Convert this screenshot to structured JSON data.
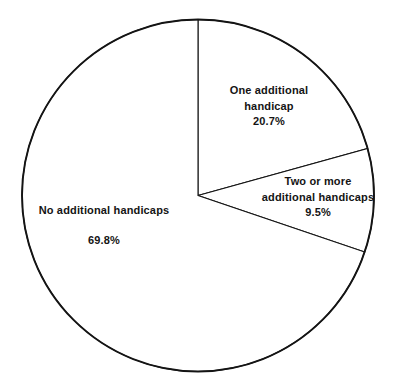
{
  "chart_data": {
    "type": "pie",
    "title": "",
    "subtitle": "",
    "xlabel": "",
    "ylabel": "",
    "legend_position": "none",
    "grid": false,
    "units": "percent",
    "total": 100,
    "start_angle_deg": 0,
    "direction": "clockwise",
    "categories": [
      "One additional handicap",
      "Two or more additional handicaps",
      "No additional handicaps"
    ],
    "values": [
      20.7,
      9.5,
      69.8
    ],
    "value_labels": [
      "20.7%",
      "9.5%",
      "69.8%"
    ],
    "slices": [
      {
        "name": "One additional handicap",
        "label_line1": "One additional",
        "label_line2": "handicap",
        "value": 20.7,
        "value_label": "20.7%",
        "start_deg": 0,
        "end_deg": 74.5,
        "fill": "#ffffff",
        "stroke": "#141414"
      },
      {
        "name": "Two or more additional handicaps",
        "label_line1": "Two or more",
        "label_line2": "additional handicaps",
        "value": 9.5,
        "value_label": "9.5%",
        "start_deg": 74.5,
        "end_deg": 108.7,
        "fill": "#ffffff",
        "stroke": "#141414"
      },
      {
        "name": "No additional handicaps",
        "label_line1": "No additional handicaps",
        "label_line2": "",
        "value": 69.8,
        "value_label": "69.8%",
        "start_deg": 108.7,
        "end_deg": 360,
        "fill": "#ffffff",
        "stroke": "#141414"
      }
    ]
  },
  "colors": {
    "background": "#ffffff",
    "outline": "#141414",
    "divider": "#1f1f1f",
    "text": "#141414"
  }
}
